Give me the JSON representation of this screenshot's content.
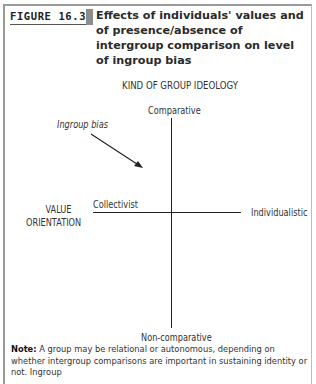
{
  "figure": {
    "label": "FIGURE 16.3",
    "title": "Effects of individuals' values and of presence/absence of intergroup comparison on level of ingroup bias",
    "colors": {
      "accent_bar": "#8c8c8c",
      "frame": "#9a9a9a",
      "axes": "#222222"
    }
  },
  "diagram": {
    "top_heading": "KIND OF GROUP IDEOLOGY",
    "vertical_axis": {
      "top_label": "Comparative",
      "bottom_label": "Non-comparative"
    },
    "horizontal_axis": {
      "title_line1": "VALUE",
      "title_line2": "ORIENTATION",
      "left_label": "Collectivist",
      "right_label": "Individualistic"
    },
    "annotation": {
      "label": "Ingroup bias",
      "arrow": "arrow pointing down-right toward upper-left quadrant"
    }
  },
  "note": {
    "prefix": "Note:",
    "text": " A group may be relational or autonomous, depending on whether intergroup comparisons are important in sustaining identity or not. Ingroup"
  }
}
